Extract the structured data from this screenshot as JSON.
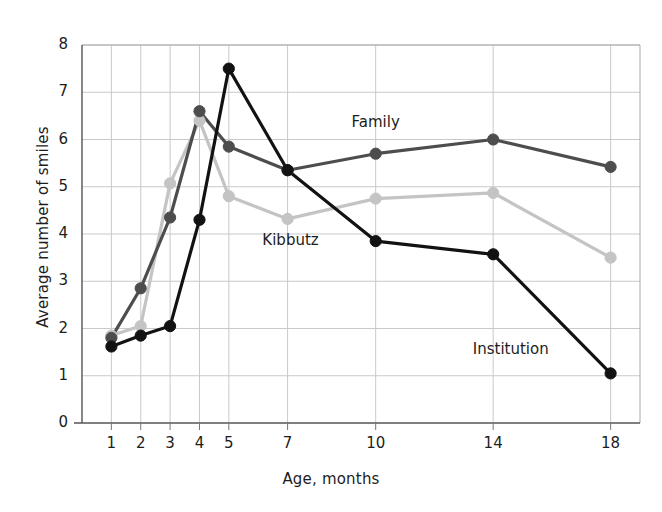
{
  "chart_data": {
    "type": "line",
    "title": "",
    "xlabel": "Age, months",
    "ylabel": "Average number of smiles",
    "x": [
      1,
      2,
      3,
      4,
      5,
      7,
      10,
      14,
      18
    ],
    "xtick_labels": [
      "1",
      "2",
      "3",
      "4",
      "5",
      "7",
      "10",
      "14",
      "18"
    ],
    "ytick_labels": [
      "0",
      "1",
      "2",
      "3",
      "4",
      "5",
      "6",
      "7",
      "8"
    ],
    "xlim": [
      0,
      19
    ],
    "ylim": [
      0,
      8
    ],
    "grid": true,
    "legend_position": "inline-annotations",
    "series": [
      {
        "name": "Family",
        "color": "#4d4d4d",
        "marker": "circle",
        "values": [
          1.8,
          2.85,
          4.35,
          6.6,
          5.85,
          5.35,
          5.7,
          6.0,
          5.42
        ]
      },
      {
        "name": "Kibbutz",
        "color": "#c4c4c4",
        "marker": "circle",
        "values": [
          1.85,
          2.05,
          5.07,
          6.4,
          4.8,
          4.32,
          4.75,
          4.87,
          3.5
        ]
      },
      {
        "name": "Institution",
        "color": "#121212",
        "marker": "circle",
        "values": [
          1.62,
          1.85,
          2.05,
          4.3,
          7.5,
          5.35,
          3.85,
          3.57,
          1.05
        ]
      }
    ],
    "annotations": [
      {
        "text": "Family",
        "x": 10,
        "y": 6.35
      },
      {
        "text": "Kibbutz",
        "x": 7.1,
        "y": 3.85
      },
      {
        "text": "Institution",
        "x": 14.6,
        "y": 1.55
      }
    ]
  }
}
